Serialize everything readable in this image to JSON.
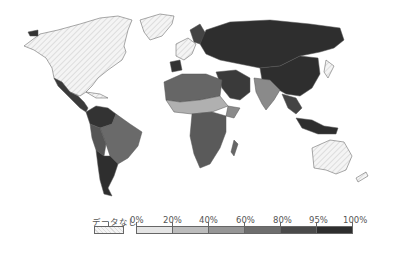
{
  "map": {
    "type": "choropleth",
    "projection": "world",
    "no_data_regions": [
      "North America (USA, Canada)",
      "Greenland",
      "Australia",
      "New Zealand",
      "Western Europe"
    ],
    "regions_shading": {
      "Mexico": "80-95%",
      "Central America": "80-95%",
      "South America north": "80-95%",
      "Brazil": "60-80%",
      "Argentina/Chile": "95-100%",
      "Russia/Central Asia": "95-100%",
      "China": "95-100%",
      "India": "40-60%",
      "Middle East": "80-95%",
      "North Africa": "60-80%",
      "Sahel": "20-40%",
      "Sub-Saharan Africa": "60-80%",
      "Southeast Asia": "80-95%",
      "Indonesia": "95-100%"
    }
  },
  "legend": {
    "no_data_label": "データなし",
    "no_data_color": "#f0f0f0",
    "ticks": [
      "0%",
      "20%",
      "40%",
      "60%",
      "80%",
      "95%",
      "100%"
    ],
    "bins": [
      {
        "range": "0-20%",
        "color": "#e4e4e4"
      },
      {
        "range": "20-40%",
        "color": "#bcbcbc"
      },
      {
        "range": "40-60%",
        "color": "#969696"
      },
      {
        "range": "60-80%",
        "color": "#6e6e6e"
      },
      {
        "range": "80-95%",
        "color": "#4a4a4a"
      },
      {
        "range": "95-100%",
        "color": "#2e2e2e"
      }
    ]
  }
}
